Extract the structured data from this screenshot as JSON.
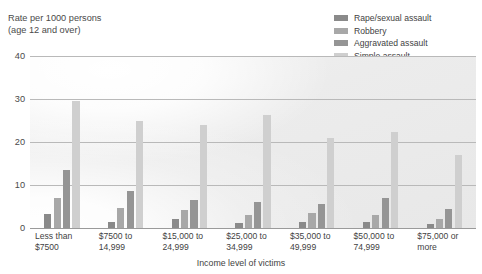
{
  "chart_data": {
    "type": "bar",
    "title": "",
    "ylabel": "Rate per 1000 persons\n(age 12 and over)",
    "xlabel": "Income level of victims",
    "ylim": [
      0,
      40
    ],
    "yticks": [
      0,
      10,
      20,
      30,
      40
    ],
    "grid": true,
    "legend_position": "top-right",
    "categories": [
      "Less than\n$7500",
      "$7500 to\n14,999",
      "$15,000 to\n24,999",
      "$25,000 to\n34,999",
      "$35,000 to\n49,999",
      "$50,000 to\n74,999",
      "$75,000 or\nmore"
    ],
    "series": [
      {
        "name": "Rape/sexual assault",
        "color": "#8a8a8a",
        "values": [
          3.3,
          1.5,
          2.0,
          1.1,
          1.5,
          1.4,
          0.9
        ]
      },
      {
        "name": "Robbery",
        "color": "#a8a8a8",
        "values": [
          7.0,
          4.6,
          4.1,
          3.1,
          3.4,
          3.0,
          2.1
        ]
      },
      {
        "name": "Aggravated assault",
        "color": "#959595",
        "values": [
          13.5,
          8.6,
          6.6,
          6.0,
          5.6,
          7.0,
          4.5
        ]
      },
      {
        "name": "Simple assault",
        "color": "#cfcfcf",
        "values": [
          29.5,
          25.0,
          24.0,
          26.2,
          21.0,
          22.4,
          17.0
        ]
      }
    ]
  },
  "axis": {
    "y_title": "Rate per 1000 persons\n(age 12 and over)",
    "x_title": "Income level of victims",
    "tick_40": "40",
    "tick_30": "30",
    "tick_20": "20",
    "tick_10": "10",
    "tick_0": "0"
  },
  "legend": {
    "items": [
      {
        "label": "Rape/sexual assault",
        "color": "#8a8a8a"
      },
      {
        "label": "Robbery",
        "color": "#a8a8a8"
      },
      {
        "label": "Aggravated assault",
        "color": "#959595"
      },
      {
        "label": "Simple assault",
        "color": "#cfcfcf"
      }
    ]
  }
}
